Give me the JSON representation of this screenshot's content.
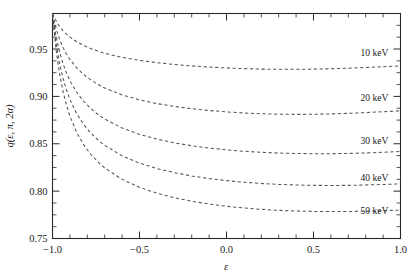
{
  "chart_data": {
    "type": "line",
    "title": "",
    "xlabel": "ε",
    "ylabel": "q(ε, π, 2α)",
    "xlim": [
      -1.0,
      1.0
    ],
    "ylim": [
      0.75,
      0.9875
    ],
    "grid": false,
    "legend_position": "inline-right",
    "linestyle": "dashed",
    "xticks": [
      -1.0,
      -0.5,
      0.0,
      0.5,
      1.0
    ],
    "xticklabels": [
      "-1.0",
      "-0.5",
      "0.0",
      "0.5",
      "1.0"
    ],
    "yticks": [
      0.75,
      0.8,
      0.85,
      0.9,
      0.95
    ],
    "yticklabels": [
      "0.75",
      "0.80",
      "0.85",
      "0.90",
      "0.95"
    ],
    "x": [
      -1.0,
      -0.98,
      -0.96,
      -0.94,
      -0.92,
      -0.9,
      -0.86,
      -0.82,
      -0.78,
      -0.74,
      -0.7,
      -0.6,
      -0.5,
      -0.4,
      -0.3,
      -0.2,
      -0.1,
      0.0,
      0.1,
      0.2,
      0.3,
      0.4,
      0.5,
      0.6,
      0.7,
      0.8,
      0.9,
      1.0
    ],
    "series": [
      {
        "name": "10 keV",
        "label": "10 keV",
        "energy_keV": 10,
        "color": "#555555",
        "label_x": 0.93,
        "label_y": 0.943,
        "values": [
          0.9875,
          0.98,
          0.974,
          0.9694,
          0.9657,
          0.9626,
          0.9576,
          0.9537,
          0.9505,
          0.9478,
          0.9455,
          0.9412,
          0.938,
          0.9356,
          0.9337,
          0.9322,
          0.931,
          0.93,
          0.9293,
          0.9288,
          0.9286,
          0.9286,
          0.9288,
          0.9292,
          0.9298,
          0.9305,
          0.9313,
          0.9322
        ]
      },
      {
        "name": "20 keV",
        "label": "20 keV",
        "energy_keV": 20,
        "color": "#555555",
        "label_x": 0.93,
        "label_y": 0.895,
        "values": [
          0.987,
          0.972,
          0.9606,
          0.9518,
          0.9448,
          0.939,
          0.93,
          0.923,
          0.9175,
          0.9128,
          0.9089,
          0.9016,
          0.8964,
          0.8924,
          0.8894,
          0.887,
          0.8851,
          0.8836,
          0.8825,
          0.8817,
          0.8812,
          0.881,
          0.8811,
          0.8815,
          0.8821,
          0.8829,
          0.8838,
          0.8848
        ]
      },
      {
        "name": "30 keV",
        "label": "30 keV",
        "energy_keV": 30,
        "color": "#555555",
        "label_x": 0.93,
        "label_y": 0.85,
        "values": [
          0.9865,
          0.964,
          0.9474,
          0.9348,
          0.9248,
          0.9166,
          0.9041,
          0.8947,
          0.8873,
          0.8812,
          0.8761,
          0.8666,
          0.8599,
          0.8549,
          0.851,
          0.8479,
          0.8455,
          0.8436,
          0.8421,
          0.841,
          0.8402,
          0.8397,
          0.8395,
          0.8395,
          0.8398,
          0.8403,
          0.841,
          0.8419
        ]
      },
      {
        "name": "40 keV",
        "label": "40 keV",
        "energy_keV": 40,
        "color": "#555555",
        "label_x": 0.93,
        "label_y": 0.811,
        "values": [
          0.986,
          0.9568,
          0.9355,
          0.9195,
          0.907,
          0.8968,
          0.8814,
          0.8701,
          0.8613,
          0.8542,
          0.8483,
          0.8373,
          0.8296,
          0.8239,
          0.8195,
          0.816,
          0.8133,
          0.8111,
          0.8094,
          0.8081,
          0.8071,
          0.8065,
          0.8061,
          0.806,
          0.8061,
          0.8065,
          0.807,
          0.8077
        ]
      },
      {
        "name": "50 keV",
        "label": "50 keV",
        "energy_keV": 50,
        "color": "#555555",
        "label_x": 0.93,
        "label_y": 0.776,
        "values": [
          0.9855,
          0.95,
          0.9246,
          0.9056,
          0.891,
          0.8792,
          0.8616,
          0.8488,
          0.8389,
          0.831,
          0.8245,
          0.8124,
          0.804,
          0.7978,
          0.7931,
          0.7893,
          0.7864,
          0.784,
          0.7822,
          0.7808,
          0.7797,
          0.779,
          0.7786,
          0.7784,
          0.7785,
          0.7788,
          0.7793,
          0.78
        ]
      }
    ]
  },
  "axes": {
    "y_axis_label": "q(ε, π, 2α)",
    "x_axis_label": "ε"
  }
}
